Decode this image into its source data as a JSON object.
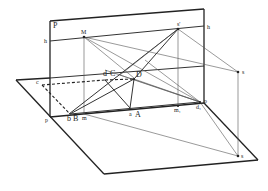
{
  "diagram": {
    "labels": {
      "picture_plane": "P",
      "horizon_left": "h",
      "horizon_right": "h",
      "vanishing_M": "M",
      "station_prime": "s'",
      "station_s_upper": "s",
      "station_s_lower": "s",
      "point_c": "c",
      "point_d": "d",
      "point_C": "C",
      "point_D": "D",
      "point_b": "b",
      "point_B": "B",
      "point_m": "m",
      "point_a": "a",
      "point_A": "A",
      "point_p_left": "p",
      "point_p_right": "p",
      "point_m1": "m₁",
      "point_d1": "d₁"
    },
    "colors": {
      "line": "#222222",
      "thin_line": "#555555",
      "background": "#ffffff"
    }
  }
}
